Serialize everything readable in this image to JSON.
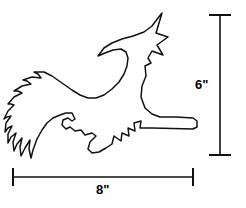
{
  "figure": {
    "name": "witch-on-broomstick-pattern",
    "subject_label": "flying witch silhouette outline",
    "style": "black line drawing on white background",
    "line_color": "#111111",
    "background_color": "#ffffff",
    "fill": "none",
    "parts": [
      "pointed-witch-hat",
      "face-profile",
      "cloak-body",
      "outstretched-arm",
      "jagged-dress-hem",
      "broom-handle",
      "broom-bristles"
    ]
  },
  "dimensions": {
    "height": {
      "label": "6\"",
      "value": 6,
      "unit": "inch",
      "orientation": "vertical",
      "position": "right"
    },
    "width": {
      "label": "8\"",
      "value": 8,
      "unit": "inch",
      "orientation": "horizontal",
      "position": "bottom"
    }
  },
  "icons": {
    "height_dimension_line": "vertical-dimension-line-icon",
    "width_dimension_line": "horizontal-dimension-line-icon"
  }
}
